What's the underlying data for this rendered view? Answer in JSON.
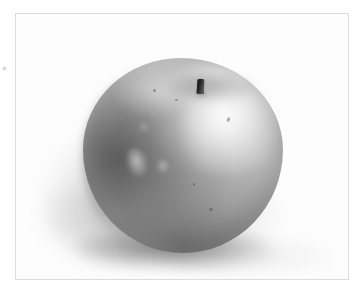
{
  "page": {
    "background_color": "#ffffff",
    "width": 361,
    "height": 294
  },
  "frame": {
    "name": "photo-frame",
    "border_color": "#dcdcdc",
    "fill_color": "#fdfdfd",
    "left": 15,
    "top": 13,
    "width": 334,
    "height": 267
  },
  "photo": {
    "subject": "apple",
    "rendering": "grayscale-photograph",
    "description": "A single whole apple photographed against a plain white background, lit from the upper right, casting a soft gray shadow toward the lower left.",
    "colors": {
      "apple_midtone": "#bdbdbd",
      "apple_shadow": "#7c7c7c",
      "apple_highlight": "#f0f0f0",
      "stem_dark": "#1c1c1c",
      "cast_shadow": "#8c8c8c",
      "background": "#ffffff"
    },
    "parts": [
      {
        "name": "apple-body",
        "label": "apple body"
      },
      {
        "name": "apple-stem",
        "label": "stem"
      },
      {
        "name": "stem-well",
        "label": "stem well"
      },
      {
        "name": "apple-highlight",
        "label": "specular highlight"
      },
      {
        "name": "cast-shadow",
        "label": "cast shadow"
      }
    ],
    "lighting": {
      "direction": "upper-right",
      "highlight_position": "upper-right shoulder",
      "shadow_direction": "lower-left"
    }
  },
  "artifacts": {
    "edge_speck": {
      "name": "edge-speck",
      "left": 2,
      "top": 66,
      "note": "faint gray scanning speck at the far left margin"
    }
  }
}
